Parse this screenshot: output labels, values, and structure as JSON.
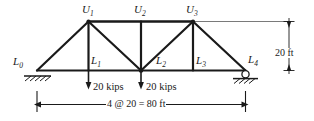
{
  "figure": {
    "kind": "truss-free-body-diagram",
    "colors": {
      "member": "#1a1a1a",
      "thin_line": "#6b6b6b",
      "text": "#1a1a1a",
      "background": "#ffffff"
    },
    "joint_labels": {
      "u1": "U",
      "u1_sub": "1",
      "u2": "U",
      "u2_sub": "2",
      "u3": "U",
      "u3_sub": "3",
      "l0": "L",
      "l0_sub": "0",
      "l1": "L",
      "l1_sub": "1",
      "l2": "L",
      "l2_sub": "2",
      "l3": "L",
      "l3_sub": "3",
      "l4": "L",
      "l4_sub": "4"
    },
    "loads": [
      {
        "label": "20 kips",
        "magnitude": 20,
        "unit": "kips",
        "at_joint": "L1",
        "direction": "down"
      },
      {
        "label": "20 kips",
        "magnitude": 20,
        "unit": "kips",
        "at_joint": "L2",
        "direction": "down"
      }
    ],
    "dimensions": {
      "height": "20 ft",
      "span": "4 @ 20 = 80 ft"
    },
    "supports": [
      {
        "at_joint": "L0",
        "type": "pin"
      },
      {
        "at_joint": "L4",
        "type": "roller"
      }
    ]
  }
}
